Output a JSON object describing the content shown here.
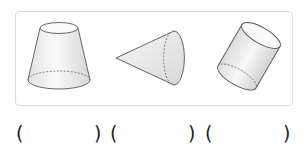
{
  "figure": {
    "shapes": [
      {
        "name": "frustum",
        "label": "truncated cone (frustum)"
      },
      {
        "name": "cone",
        "label": "cone lying on side"
      },
      {
        "name": "cylinder",
        "label": "tilted cylinder"
      }
    ]
  },
  "answers": {
    "blanks": [
      {
        "open": "(",
        "close": ")",
        "value": ""
      },
      {
        "open": "(",
        "close": ")",
        "value": ""
      },
      {
        "open": "(",
        "close": ")",
        "value": ""
      }
    ]
  },
  "colors": {
    "stroke": "#555555",
    "fill_light": "#f6f6f6",
    "fill_dark": "#dcdcdc",
    "frame": "#d9d9d9"
  }
}
